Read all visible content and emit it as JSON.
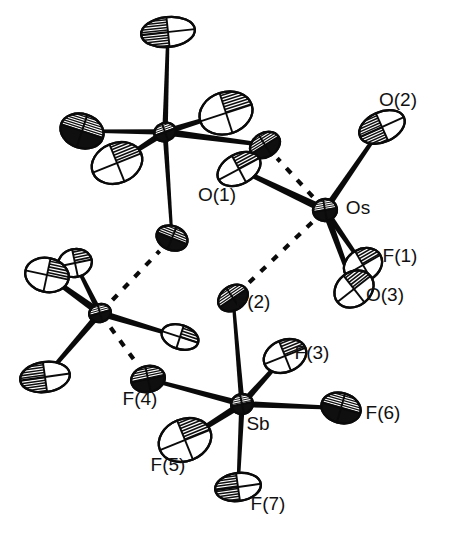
{
  "figure": {
    "kind": "ortep-thermal-ellipsoid-plot",
    "background_color": "#ffffff",
    "line_color": "#0a0a0a",
    "label_color": "#111111",
    "width": 460,
    "height": 546
  },
  "labels": [
    {
      "id": "O2",
      "text": "O(2)",
      "x": 398,
      "y": 101
    },
    {
      "id": "O1",
      "text": "O(1)",
      "x": 217,
      "y": 196
    },
    {
      "id": "Os",
      "text": "Os",
      "x": 358,
      "y": 209
    },
    {
      "id": "F1",
      "text": "F(1)",
      "x": 400,
      "y": 257
    },
    {
      "id": "O3",
      "text": "O(3)",
      "x": 385,
      "y": 296
    },
    {
      "id": "F2",
      "text": "F(2)",
      "x": 253,
      "y": 303
    },
    {
      "id": "F3",
      "text": "F(3)",
      "x": 312,
      "y": 354
    },
    {
      "id": "F6",
      "text": "F(6)",
      "x": 383,
      "y": 414
    },
    {
      "id": "Sb",
      "text": "Sb",
      "x": 258,
      "y": 425
    },
    {
      "id": "F4",
      "text": "F(4)",
      "x": 140,
      "y": 400
    },
    {
      "id": "F5",
      "text": "F(5)",
      "x": 168,
      "y": 466
    },
    {
      "id": "F7",
      "text": "F(7)",
      "x": 268,
      "y": 505
    }
  ],
  "atoms": [
    {
      "id": "M1",
      "label": "",
      "x": 165,
      "y": 132,
      "rx": 11,
      "ry": 9,
      "rot": -20,
      "style": "metal"
    },
    {
      "id": "M1-a",
      "label": "",
      "x": 168,
      "y": 32,
      "rx": 27,
      "ry": 15,
      "rot": -6,
      "style": "hatched-left"
    },
    {
      "id": "M1-b",
      "label": "",
      "x": 82,
      "y": 131,
      "rx": 22,
      "ry": 17,
      "rot": 18,
      "style": "hatched-dense"
    },
    {
      "id": "M1-c",
      "label": "",
      "x": 117,
      "y": 163,
      "rx": 26,
      "ry": 20,
      "rot": -22,
      "style": "hatched-right"
    },
    {
      "id": "M1-d",
      "label": "",
      "x": 226,
      "y": 113,
      "rx": 27,
      "ry": 21,
      "rot": -18,
      "style": "hatched-right"
    },
    {
      "id": "M1-e",
      "label": "",
      "x": 265,
      "y": 145,
      "rx": 16,
      "ry": 12,
      "rot": -32,
      "style": "hatched-dense"
    },
    {
      "id": "M1-f",
      "label": "",
      "x": 172,
      "y": 238,
      "rx": 16,
      "ry": 12,
      "rot": 22,
      "style": "hatched-dense"
    },
    {
      "id": "M2",
      "label": "",
      "x": 100,
      "y": 313,
      "rx": 11,
      "ry": 9,
      "rot": -16,
      "style": "metal"
    },
    {
      "id": "M2-a",
      "label": "",
      "x": 75,
      "y": 263,
      "rx": 17,
      "ry": 14,
      "rot": -12,
      "style": "hatched-right"
    },
    {
      "id": "M2-b",
      "label": "",
      "x": 47,
      "y": 275,
      "rx": 22,
      "ry": 17,
      "rot": 12,
      "style": "hatched-right"
    },
    {
      "id": "M2-c",
      "label": "",
      "x": 45,
      "y": 377,
      "rx": 25,
      "ry": 15,
      "rot": -8,
      "style": "hatched-left"
    },
    {
      "id": "M2-d",
      "label": "",
      "x": 180,
      "y": 337,
      "rx": 19,
      "ry": 12,
      "rot": 18,
      "style": "hatched-right"
    },
    {
      "id": "Os",
      "label": "Os",
      "x": 325,
      "y": 210,
      "rx": 12,
      "ry": 11,
      "rot": -10,
      "style": "metal"
    },
    {
      "id": "O2atom",
      "label": "O(2)",
      "x": 382,
      "y": 127,
      "rx": 24,
      "ry": 15,
      "rot": -24,
      "style": "hatched-left"
    },
    {
      "id": "O1atom",
      "label": "O(1)",
      "x": 239,
      "y": 169,
      "rx": 23,
      "ry": 15,
      "rot": -28,
      "style": "hatched-right"
    },
    {
      "id": "F1atom",
      "label": "F(1)",
      "x": 363,
      "y": 265,
      "rx": 20,
      "ry": 16,
      "rot": -30,
      "style": "hatched-right"
    },
    {
      "id": "O3atom",
      "label": "O(3)",
      "x": 354,
      "y": 289,
      "rx": 21,
      "ry": 17,
      "rot": -38,
      "style": "hatched-right"
    },
    {
      "id": "Sb",
      "label": "Sb",
      "x": 242,
      "y": 404,
      "rx": 11,
      "ry": 10,
      "rot": -12,
      "style": "metal"
    },
    {
      "id": "F2atom",
      "label": "F(2)",
      "x": 233,
      "y": 298,
      "rx": 16,
      "ry": 12,
      "rot": -34,
      "style": "hatched-dense"
    },
    {
      "id": "F3atom",
      "label": "F(3)",
      "x": 285,
      "y": 356,
      "rx": 22,
      "ry": 16,
      "rot": -22,
      "style": "hatched-right"
    },
    {
      "id": "F6atom",
      "label": "F(6)",
      "x": 341,
      "y": 408,
      "rx": 20,
      "ry": 15,
      "rot": 16,
      "style": "hatched-dense"
    },
    {
      "id": "F7atom",
      "label": "F(7)",
      "x": 238,
      "y": 487,
      "rx": 23,
      "ry": 14,
      "rot": -8,
      "style": "hatched-left"
    },
    {
      "id": "F5atom",
      "label": "F(5)",
      "x": 185,
      "y": 440,
      "rx": 27,
      "ry": 21,
      "rot": -22,
      "style": "hatched-right"
    },
    {
      "id": "F4atom",
      "label": "F(4)",
      "x": 148,
      "y": 379,
      "rx": 17,
      "ry": 13,
      "rot": -12,
      "style": "hatched-dense"
    }
  ],
  "bonds": [
    {
      "from": "M1",
      "to": "M1-a",
      "width": 4.6
    },
    {
      "from": "M1",
      "to": "M1-b",
      "width": 4.6
    },
    {
      "from": "M1",
      "to": "M1-c",
      "width": 5.6
    },
    {
      "from": "M1",
      "to": "M1-d",
      "width": 5.4
    },
    {
      "from": "M1",
      "to": "M1-e",
      "width": 6.0
    },
    {
      "from": "M1",
      "to": "M1-f",
      "width": 4.2
    },
    {
      "from": "M2",
      "to": "M2-a",
      "width": 4.8
    },
    {
      "from": "M2",
      "to": "M2-b",
      "width": 6.2
    },
    {
      "from": "M2",
      "to": "M2-c",
      "width": 5.4
    },
    {
      "from": "M2",
      "to": "M2-d",
      "width": 5.6
    },
    {
      "from": "Os",
      "to": "O2atom",
      "width": 5.4
    },
    {
      "from": "Os",
      "to": "O1atom",
      "width": 6.4
    },
    {
      "from": "Os",
      "to": "F1atom",
      "width": 5.2
    },
    {
      "from": "Os",
      "to": "O3atom",
      "width": 5.6
    },
    {
      "from": "Sb",
      "to": "F2atom",
      "width": 4.4
    },
    {
      "from": "Sb",
      "to": "F3atom",
      "width": 5.4
    },
    {
      "from": "Sb",
      "to": "F6atom",
      "width": 5.2
    },
    {
      "from": "Sb",
      "to": "F7atom",
      "width": 4.6
    },
    {
      "from": "Sb",
      "to": "F5atom",
      "width": 5.8
    },
    {
      "from": "Sb",
      "to": "F4atom",
      "width": 5.2
    }
  ],
  "contacts": [
    {
      "from": "Os",
      "to": "M1-e",
      "kind": "dashed-contact"
    },
    {
      "from": "Os",
      "to": "F2atom",
      "kind": "dashed-contact"
    },
    {
      "from": "M2",
      "to": "M1-f",
      "kind": "dashed-contact"
    },
    {
      "from": "M2",
      "to": "F4atom",
      "kind": "dashed-contact"
    }
  ]
}
